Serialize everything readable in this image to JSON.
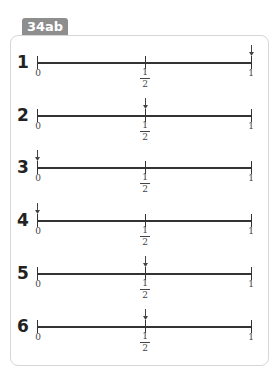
{
  "badge": "34ab",
  "labels": {
    "zero": "0",
    "half_num": "1",
    "half_den": "2",
    "one": "1"
  },
  "rows": [
    {
      "number": "1",
      "arrow_at": "1",
      "y": 62
    },
    {
      "number": "2",
      "arrow_at": "1/2",
      "y": 115
    },
    {
      "number": "3",
      "arrow_at": "0",
      "y": 167
    },
    {
      "number": "4",
      "arrow_at": "0",
      "y": 220
    },
    {
      "number": "5",
      "arrow_at": "1/2",
      "y": 273
    },
    {
      "number": "6",
      "arrow_at": "1/2",
      "y": 326
    }
  ]
}
